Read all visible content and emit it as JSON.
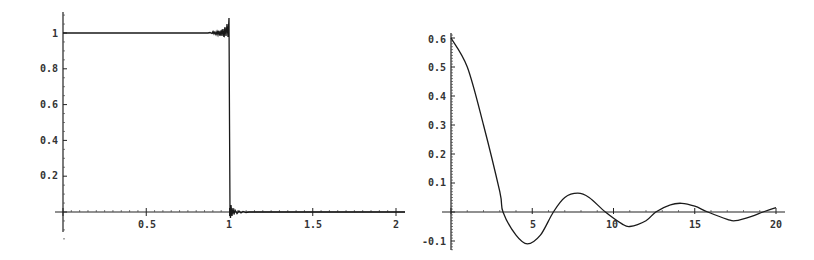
{
  "chart_data": [
    {
      "type": "line",
      "title": "",
      "xlabel": "",
      "ylabel": "",
      "xlim": [
        0,
        2
      ],
      "ylim": [
        0,
        1.08
      ],
      "grid": false,
      "legend": null,
      "x_ticks": [
        "0.5",
        "1",
        "1.5",
        "2"
      ],
      "y_ticks": [
        "0.2",
        "0.4",
        "0.6",
        "0.8",
        "1"
      ],
      "description": "Square pulse (partial Fourier reconstruction) with Gibbs ringing near x=1",
      "series": [
        {
          "name": "f(x)",
          "x": [
            0,
            0.9,
            0.95,
            0.98,
            0.995,
            1.0,
            1.005,
            1.02,
            1.05,
            1.1,
            1.5,
            2.0
          ],
          "y": [
            1,
            1,
            1.0,
            1.02,
            1.08,
            0.5,
            -0.03,
            0.02,
            0.0,
            0.0,
            0,
            0
          ]
        }
      ]
    },
    {
      "type": "line",
      "title": "",
      "xlabel": "",
      "ylabel": "",
      "xlim": [
        0,
        20
      ],
      "ylim": [
        -0.12,
        0.62
      ],
      "grid": false,
      "legend": null,
      "x_ticks": [
        "5",
        "10",
        "15",
        "20"
      ],
      "y_ticks": [
        "-0.1",
        "0.1",
        "0.2",
        "0.3",
        "0.4",
        "0.5",
        "0.6"
      ],
      "description": "Damped oscillation (sinc-like Fourier coefficient decay)",
      "series": [
        {
          "name": "g(x)",
          "x": [
            0,
            1,
            2,
            3,
            3.2,
            4,
            4.7,
            5.5,
            6.3,
            7,
            7.8,
            8.5,
            9.5,
            10.5,
            11,
            12,
            12.6,
            13.5,
            14.2,
            15,
            15.8,
            17,
            17.5,
            18.5,
            19.2,
            20
          ],
          "y": [
            0.6,
            0.5,
            0.3,
            0.07,
            0.0,
            -0.08,
            -0.11,
            -0.08,
            0.0,
            0.05,
            0.065,
            0.05,
            0.0,
            -0.04,
            -0.05,
            -0.03,
            0.0,
            0.025,
            0.03,
            0.02,
            0.0,
            -0.025,
            -0.03,
            -0.015,
            0.0,
            0.015
          ]
        }
      ]
    }
  ],
  "labels": {
    "left": {
      "x_ticks": [
        "0.5",
        "1",
        "1.5",
        "2"
      ],
      "y_ticks": [
        "0.2",
        "0.4",
        "0.6",
        "0.8",
        "1"
      ]
    },
    "right": {
      "x_ticks": [
        "5",
        "10",
        "15",
        "20"
      ],
      "y_ticks": [
        "0.6",
        "0.5",
        "0.4",
        "0.3",
        "0.2",
        "0.1",
        "-0.1"
      ]
    }
  }
}
